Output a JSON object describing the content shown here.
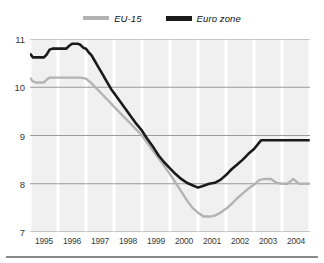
{
  "legend": {
    "position": "top-center",
    "entries": [
      {
        "label": "EU-15",
        "color": "#b3b3b3",
        "icon": "line-swatch-gray"
      },
      {
        "label": "Euro zone",
        "color": "#1a1a1a",
        "icon": "line-swatch-black"
      }
    ]
  },
  "chart_data": {
    "type": "line",
    "title": "",
    "subtitle": "",
    "xlabel": "",
    "ylabel": "",
    "xlim": [
      1995,
      2005
    ],
    "ylim": [
      7,
      11
    ],
    "yticks": [
      7,
      8,
      9,
      10,
      11
    ],
    "ytick_labels": [
      "7",
      "8",
      "9",
      "10",
      "11"
    ],
    "xticks": [
      1995,
      1996,
      1997,
      1998,
      1999,
      2000,
      2001,
      2002,
      2003,
      2004
    ],
    "xtick_labels": [
      "1995",
      "1996",
      "1997",
      "1998",
      "1999",
      "2000",
      "2001",
      "2002",
      "2003",
      "2004"
    ],
    "grid": "both",
    "legend_position": "top-center",
    "series": [
      {
        "name": "Euro zone",
        "color": "#1a1a1a",
        "x": [
          1995.0,
          1995.1,
          1995.2,
          1995.3,
          1995.4,
          1995.5,
          1995.6,
          1995.7,
          1995.8,
          1995.9,
          1996.0,
          1996.1,
          1996.2,
          1996.3,
          1996.4,
          1996.5,
          1996.6,
          1996.7,
          1996.8,
          1996.9,
          1997.0,
          1997.1,
          1997.2,
          1997.3,
          1997.4,
          1997.5,
          1997.6,
          1997.7,
          1997.8,
          1997.9,
          1998.0,
          1998.2,
          1998.4,
          1998.6,
          1998.8,
          1999.0,
          1999.2,
          1999.4,
          1999.6,
          1999.8,
          2000.0,
          2000.2,
          2000.4,
          2000.6,
          2000.8,
          2001.0,
          2001.2,
          2001.4,
          2001.6,
          2001.8,
          2002.0,
          2002.2,
          2002.4,
          2002.6,
          2002.8,
          2003.0,
          2003.25,
          2003.5,
          2003.75,
          2004.0,
          2004.25,
          2004.5,
          2004.75,
          2004.99
        ],
        "y": [
          10.7,
          10.62,
          10.62,
          10.62,
          10.62,
          10.62,
          10.68,
          10.78,
          10.8,
          10.8,
          10.8,
          10.8,
          10.8,
          10.8,
          10.86,
          10.9,
          10.9,
          10.9,
          10.88,
          10.82,
          10.8,
          10.72,
          10.66,
          10.56,
          10.46,
          10.36,
          10.26,
          10.16,
          10.06,
          9.96,
          9.88,
          9.72,
          9.56,
          9.4,
          9.24,
          9.1,
          8.92,
          8.76,
          8.58,
          8.44,
          8.32,
          8.2,
          8.1,
          8.02,
          7.97,
          7.92,
          7.96,
          8.0,
          8.02,
          8.08,
          8.18,
          8.3,
          8.4,
          8.5,
          8.62,
          8.72,
          8.9,
          8.9,
          8.9,
          8.9,
          8.9,
          8.9,
          8.9,
          8.9
        ],
        "label_start": 10.7,
        "label_min": 7.9,
        "label_end": 8.9
      },
      {
        "name": "EU-15",
        "color": "#b3b3b3",
        "x": [
          1995.0,
          1995.1,
          1995.2,
          1995.3,
          1995.4,
          1995.5,
          1995.6,
          1995.7,
          1995.8,
          1995.9,
          1996.0,
          1996.2,
          1996.4,
          1996.6,
          1996.8,
          1997.0,
          1997.2,
          1997.4,
          1997.6,
          1997.8,
          1998.0,
          1998.2,
          1998.4,
          1998.6,
          1998.8,
          1999.0,
          1999.2,
          1999.4,
          1999.6,
          1999.8,
          2000.0,
          2000.2,
          2000.4,
          2000.6,
          2000.8,
          2001.0,
          2001.2,
          2001.4,
          2001.6,
          2001.8,
          2002.0,
          2002.2,
          2002.4,
          2002.6,
          2002.8,
          2003.0,
          2003.2,
          2003.4,
          2003.6,
          2003.8,
          2004.0,
          2004.2,
          2004.4,
          2004.6,
          2004.8,
          2004.99
        ],
        "y": [
          10.2,
          10.12,
          10.1,
          10.1,
          10.1,
          10.1,
          10.16,
          10.2,
          10.2,
          10.2,
          10.2,
          10.2,
          10.2,
          10.2,
          10.2,
          10.18,
          10.08,
          9.96,
          9.84,
          9.72,
          9.6,
          9.48,
          9.36,
          9.24,
          9.12,
          9.0,
          8.84,
          8.68,
          8.52,
          8.36,
          8.2,
          8.02,
          7.84,
          7.66,
          7.5,
          7.4,
          7.32,
          7.32,
          7.34,
          7.4,
          7.48,
          7.58,
          7.7,
          7.8,
          7.9,
          7.98,
          8.08,
          8.1,
          8.1,
          8.02,
          8.0,
          8.0,
          8.1,
          8.0,
          8.0,
          8.0
        ],
        "label_start": 10.2,
        "label_min": 7.3,
        "label_end": 8.0
      }
    ]
  }
}
